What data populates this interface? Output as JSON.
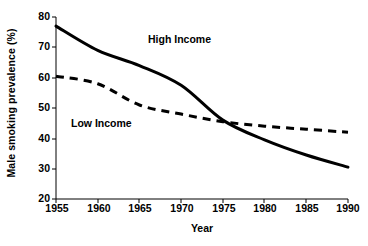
{
  "chart_data": {
    "type": "line",
    "title": "",
    "subtitle": "",
    "xlabel": "Year",
    "ylabel": "Male smoking prevalence (%)",
    "xlim": [
      1955,
      1990
    ],
    "ylim": [
      20,
      80
    ],
    "xticks": [
      1955,
      1960,
      1965,
      1970,
      1975,
      1980,
      1985,
      1990
    ],
    "yticks": [
      20,
      30,
      40,
      50,
      60,
      70,
      80
    ],
    "xtick_labels": [
      "1955",
      "1960",
      "1965",
      "1970",
      "1975",
      "1980",
      "1985",
      "1990"
    ],
    "ytick_labels": [
      "20",
      "30",
      "40",
      "50",
      "60",
      "70",
      "80"
    ],
    "grid": false,
    "legend": "inline-annotations",
    "x": [
      1955,
      1960,
      1965,
      1970,
      1975,
      1980,
      1985,
      1990
    ],
    "series": [
      {
        "name": "High Income",
        "style": "solid",
        "color": "#000000",
        "values": [
          77,
          69,
          64,
          57.5,
          46,
          39.5,
          34.5,
          30.5
        ],
        "annotation": "High Income"
      },
      {
        "name": "Low Income",
        "style": "dashed",
        "color": "#000000",
        "values": [
          60.5,
          58,
          51,
          48,
          45.5,
          44,
          43,
          42
        ],
        "annotation": "Low Income"
      }
    ],
    "annotations": [
      {
        "text": "High Income",
        "x": 1971,
        "y": 71
      },
      {
        "text": "Low Income",
        "x": 1957,
        "y": 45
      }
    ]
  },
  "axes": {
    "y_title": "Male smoking prevalence (%)",
    "x_title": "Year",
    "y_labels": [
      "80",
      "70",
      "60",
      "50",
      "40",
      "30",
      "20"
    ],
    "x_labels": [
      "1955",
      "1960",
      "1965",
      "1970",
      "1975",
      "1980",
      "1985",
      "1990"
    ]
  },
  "labels": {
    "high_income": "High Income",
    "low_income": "Low Income"
  },
  "colors": {
    "background": "#ffffff",
    "ink": "#000000",
    "axis": "#000000"
  }
}
